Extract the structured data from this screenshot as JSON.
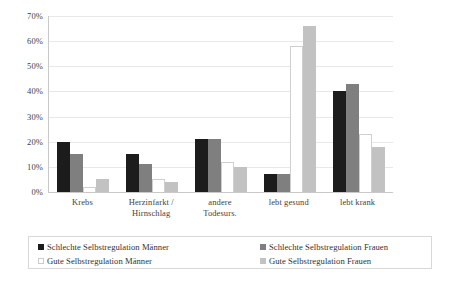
{
  "chart_data": {
    "type": "bar",
    "title": "",
    "xlabel": "",
    "ylabel": "",
    "ylim": [
      0,
      70
    ],
    "grid": true,
    "legend_position": "bottom",
    "categories": [
      "Krebs",
      "Herzinfarkt / Hirnschlag",
      "andere Todesurs.",
      "lebt gesund",
      "lebt krank"
    ],
    "category_lines": [
      [
        "Krebs"
      ],
      [
        "Herzinfarkt /",
        "Hirnschlag"
      ],
      [
        "andere",
        "Todesurs."
      ],
      [
        "lebt gesund"
      ],
      [
        "lebt krank"
      ]
    ],
    "ytick_labels": [
      "0%",
      "10%",
      "20%",
      "30%",
      "40%",
      "50%",
      "60%",
      "70%"
    ],
    "ytick_values": [
      0,
      10,
      20,
      30,
      40,
      50,
      60,
      70
    ],
    "series": [
      {
        "name": "Schlechte Selbstregulation Männer",
        "color": "#1c1c1c",
        "style": "black",
        "values": [
          20,
          15,
          21,
          7,
          40
        ]
      },
      {
        "name": "Schlechte Selbstregulation Frauen",
        "color": "#7f7f7f",
        "style": "dgray",
        "values": [
          15,
          11,
          21,
          7,
          43
        ]
      },
      {
        "name": "Gute Selbstregulation Männer",
        "color": "#ffffff",
        "style": "white",
        "values": [
          2,
          5,
          12,
          58,
          23
        ]
      },
      {
        "name": "Gute Selbstregulation Frauen",
        "color": "#c2c2c2",
        "style": "lgray",
        "values": [
          5,
          4,
          10,
          66,
          18
        ]
      }
    ]
  },
  "legend": {
    "entries": [
      {
        "label": "Schlechte Selbstregulation Männer",
        "swatch": "black"
      },
      {
        "label": "Schlechte Selbstregulation Frauen",
        "swatch": "dgray"
      },
      {
        "label": "Gute Selbstregulation Männer",
        "swatch": "white"
      },
      {
        "label": "Gute Selbstregulation Frauen",
        "swatch": "lgray"
      }
    ]
  }
}
